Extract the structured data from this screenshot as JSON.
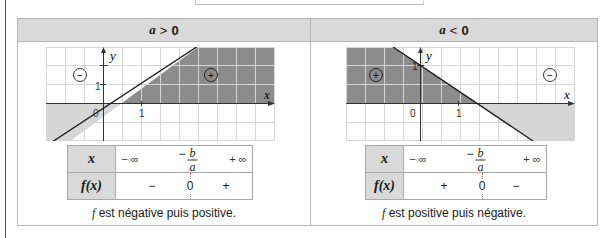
{
  "columns": [
    {
      "header": {
        "var": "a",
        "rel": ">",
        "val": "0"
      },
      "graph": {
        "x_axis_label": "x",
        "y_axis_label": "y",
        "tick_x": "1",
        "tick_y": "1",
        "origin_label": "0",
        "neg_sign_label": "−",
        "pos_sign_label": "+",
        "line": "increasing",
        "dark_region": "right of root, above axis",
        "light_region": "left of root, below axis"
      },
      "sign_table": {
        "row1_header": "x",
        "row2_header": "f(x)",
        "minus_inf": "− ∞",
        "root_num": "b",
        "root_den": "a",
        "root_sign": "−",
        "plus_inf": "+ ∞",
        "sign_left": "−",
        "zero": "0",
        "sign_right": "+"
      },
      "caption_f": "f",
      "caption_rest": " est négative puis positive."
    },
    {
      "header": {
        "var": "a",
        "rel": "<",
        "val": "0"
      },
      "graph": {
        "x_axis_label": "x",
        "y_axis_label": "y",
        "tick_x": "1",
        "tick_y": "1",
        "origin_label": "0",
        "neg_sign_label": "−",
        "pos_sign_label": "+",
        "line": "decreasing",
        "dark_region": "left of root, above axis",
        "light_region": "right of root, below axis"
      },
      "sign_table": {
        "row1_header": "x",
        "row2_header": "f(x)",
        "minus_inf": "− ∞",
        "root_num": "b",
        "root_den": "a",
        "root_sign": "−",
        "plus_inf": "+ ∞",
        "sign_left": "+",
        "zero": "0",
        "sign_right": "−"
      },
      "caption_f": "f",
      "caption_rest": " est positive puis négative."
    }
  ],
  "colors": {
    "header_bg": "#d9d9d9",
    "dark_region": "#8c8c8c",
    "light_region": "#d6d6d6",
    "grid": "#d3d3d3",
    "line": "#1a1a1a"
  }
}
